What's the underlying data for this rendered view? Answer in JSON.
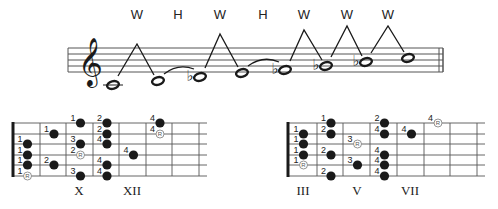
{
  "staff": {
    "x_start": 68,
    "x_end": 443,
    "lines_y": [
      48,
      54,
      60,
      66,
      72
    ],
    "clef": "treble-clef",
    "notes": [
      {
        "name": "C",
        "accidental": "",
        "x": 113,
        "y": 85
      },
      {
        "name": "D",
        "accidental": "",
        "x": 158,
        "y": 81
      },
      {
        "name": "Eb",
        "accidental": "♭",
        "x": 200,
        "y": 77
      },
      {
        "name": "F",
        "accidental": "",
        "x": 242,
        "y": 73
      },
      {
        "name": "Gb",
        "accidental": "♭",
        "x": 285,
        "y": 70
      },
      {
        "name": "Ab",
        "accidental": "♭",
        "x": 326,
        "y": 66
      },
      {
        "name": "Bb",
        "accidental": "♭",
        "x": 366,
        "y": 62
      },
      {
        "name": "C",
        "accidental": "",
        "x": 408,
        "y": 58
      }
    ],
    "intervals": [
      {
        "label": "W",
        "x": 137,
        "peak_y": 44,
        "from": 0,
        "to": 1,
        "type": "whole"
      },
      {
        "label": "H",
        "x": 178,
        "from": 1,
        "to": 2,
        "type": "half"
      },
      {
        "label": "W",
        "x": 220,
        "peak_y": 34,
        "from": 2,
        "to": 3,
        "type": "whole"
      },
      {
        "label": "H",
        "x": 263,
        "from": 3,
        "to": 4,
        "type": "half"
      },
      {
        "label": "W",
        "x": 304,
        "peak_y": 30,
        "from": 4,
        "to": 5,
        "type": "whole"
      },
      {
        "label": "W",
        "x": 347,
        "peak_y": 26,
        "from": 5,
        "to": 6,
        "type": "whole"
      },
      {
        "label": "W",
        "x": 388,
        "peak_y": 26,
        "from": 6,
        "to": 7,
        "type": "whole"
      }
    ]
  },
  "fretboards": [
    {
      "name": "left-fretboard",
      "nut_x": 13,
      "frets_x": [
        40,
        66,
        93,
        119,
        146,
        172,
        199
      ],
      "end_x": 207,
      "strings_y": [
        123,
        134,
        144,
        155,
        165,
        176
      ],
      "position_labels": [
        {
          "label": "X",
          "x": 79
        },
        {
          "label": "XII",
          "x": 132
        }
      ],
      "dots": [
        {
          "col": 0,
          "string": 2,
          "finger": "1",
          "root": false
        },
        {
          "col": 0,
          "string": 3,
          "finger": "1",
          "root": false
        },
        {
          "col": 0,
          "string": 4,
          "finger": "1",
          "root": false
        },
        {
          "col": 0,
          "string": 5,
          "finger": "1",
          "root": true
        },
        {
          "col": 1,
          "string": 1,
          "finger": "1",
          "root": false
        },
        {
          "col": 1,
          "string": 4,
          "finger": "2",
          "root": false
        },
        {
          "col": 2,
          "string": 0,
          "finger": "1",
          "root": false
        },
        {
          "col": 2,
          "string": 2,
          "finger": "3",
          "root": false
        },
        {
          "col": 2,
          "string": 3,
          "finger": "2",
          "root": true
        },
        {
          "col": 2,
          "string": 5,
          "finger": "3",
          "root": false
        },
        {
          "col": 3,
          "string": 0,
          "finger": "2",
          "root": false
        },
        {
          "col": 3,
          "string": 1,
          "finger": "2",
          "root": false
        },
        {
          "col": 3,
          "string": 2,
          "finger": "4",
          "root": false
        },
        {
          "col": 3,
          "string": 4,
          "finger": "4",
          "root": false
        },
        {
          "col": 3,
          "string": 5,
          "finger": "4",
          "root": false
        },
        {
          "col": 4,
          "string": 3,
          "finger": "4",
          "root": false
        },
        {
          "col": 5,
          "string": 0,
          "finger": "4",
          "root": false
        },
        {
          "col": 5,
          "string": 1,
          "finger": "4",
          "root": true
        }
      ]
    },
    {
      "name": "right-fretboard",
      "nut_x": 288,
      "frets_x": [
        317,
        343,
        370,
        397,
        424,
        450,
        477
      ],
      "end_x": 485,
      "strings_y": [
        123,
        134,
        144,
        155,
        165,
        176
      ],
      "position_labels": [
        {
          "label": "III",
          "x": 303
        },
        {
          "label": "V",
          "x": 357
        },
        {
          "label": "VII",
          "x": 410
        }
      ],
      "dots": [
        {
          "col": 0,
          "string": 1,
          "finger": "1",
          "root": false
        },
        {
          "col": 0,
          "string": 2,
          "finger": "1",
          "root": false
        },
        {
          "col": 0,
          "string": 3,
          "finger": "1",
          "root": false
        },
        {
          "col": 0,
          "string": 4,
          "finger": "1",
          "root": true
        },
        {
          "col": 1,
          "string": 0,
          "finger": "1",
          "root": false
        },
        {
          "col": 1,
          "string": 1,
          "finger": "2",
          "root": false
        },
        {
          "col": 1,
          "string": 3,
          "finger": "2",
          "root": false
        },
        {
          "col": 1,
          "string": 5,
          "finger": "2",
          "root": false
        },
        {
          "col": 2,
          "string": 2,
          "finger": "3",
          "root": true
        },
        {
          "col": 2,
          "string": 4,
          "finger": "3",
          "root": false
        },
        {
          "col": 3,
          "string": 0,
          "finger": "2",
          "root": false
        },
        {
          "col": 3,
          "string": 1,
          "finger": "4",
          "root": false
        },
        {
          "col": 3,
          "string": 3,
          "finger": "4",
          "root": false
        },
        {
          "col": 3,
          "string": 4,
          "finger": "4",
          "root": false
        },
        {
          "col": 3,
          "string": 5,
          "finger": "4",
          "root": false
        },
        {
          "col": 4,
          "string": 1,
          "finger": "4",
          "root": false
        },
        {
          "col": 5,
          "string": 0,
          "finger": "4",
          "root": true
        }
      ]
    }
  ],
  "root_marker": "R",
  "colors": {
    "ink": "#1a1a1a",
    "line": "#555555",
    "root_fill": "#ffffff",
    "root_stroke": "#888888"
  }
}
